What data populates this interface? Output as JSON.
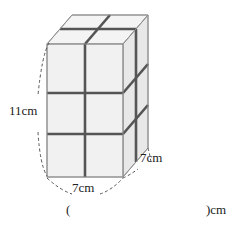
{
  "figure": {
    "labels": {
      "height": "11cm",
      "depth": "7cm",
      "width": "7cm"
    },
    "colors": {
      "face_front": "#f0f0f0",
      "face_top": "#f4f4f4",
      "face_right": "#e6e6e6",
      "edge": "#9a9a9a",
      "division": "#555555",
      "dash": "#555555"
    }
  },
  "answer": {
    "open_paren": "(",
    "blank": "",
    "close_unit": ")cm"
  }
}
